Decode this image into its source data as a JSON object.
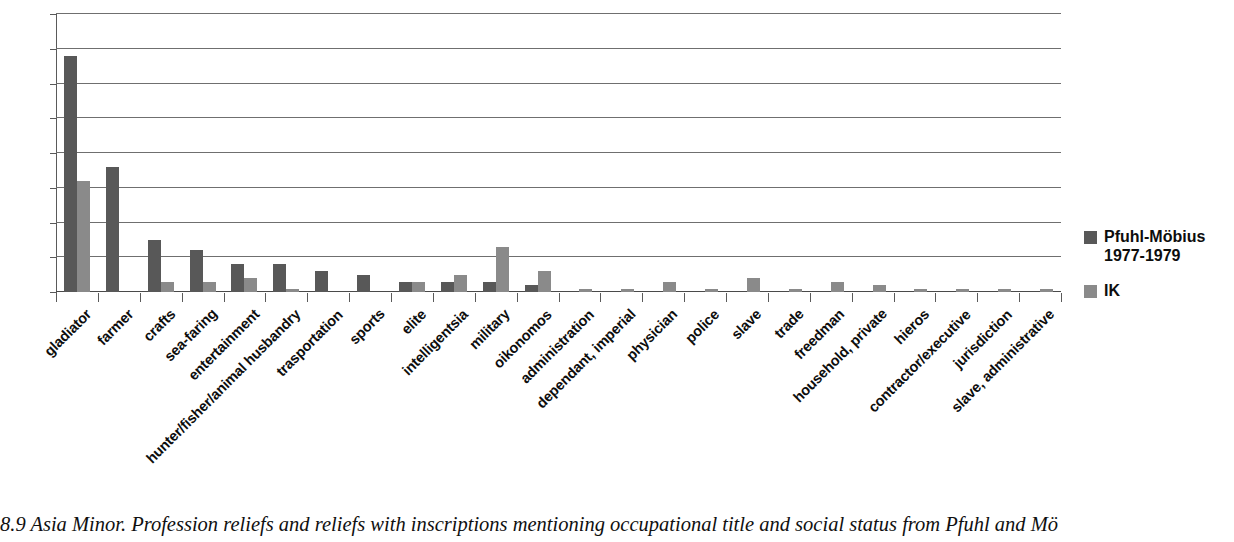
{
  "chart_data": {
    "type": "bar",
    "title": "",
    "xlabel": "",
    "ylabel": "",
    "ylim": [
      0,
      80
    ],
    "yticks": [
      0,
      10,
      20,
      30,
      40,
      50,
      60,
      70,
      80
    ],
    "grid": true,
    "legend_position": "right",
    "categories": [
      "gladiator",
      "farmer",
      "crafts",
      "sea-faring",
      "entertainment",
      "hunter/fisher/animal husbandry",
      "trasportation",
      "sports",
      "elite",
      "intelligentsia",
      "military",
      "oikonomos",
      "administration",
      "dependant, imperial",
      "physician",
      "police",
      "slave",
      "trade",
      "freedman",
      "household, private",
      "hieros",
      "contractor/executive",
      "jurisdiction",
      "slave, administrative"
    ],
    "series": [
      {
        "name": "Pfuhl-Möbius 1977-1979",
        "color": "#585858",
        "values": [
          68,
          36,
          15,
          12,
          8,
          8,
          6,
          5,
          3,
          3,
          3,
          2,
          0,
          0,
          0,
          0,
          0,
          0,
          0,
          0,
          0,
          0,
          0,
          0
        ]
      },
      {
        "name": "IK",
        "color": "#8a8a8a",
        "values": [
          32,
          0,
          3,
          3,
          4,
          1,
          0,
          0,
          3,
          5,
          13,
          6,
          1,
          1,
          3,
          1,
          4,
          1,
          3,
          2,
          1,
          1,
          1,
          1
        ]
      }
    ]
  },
  "legend": {
    "entries": [
      {
        "label": "Pfuhl-Möbius\n1977-1979",
        "swatch": "#585858"
      },
      {
        "label": "IK",
        "swatch": "#8a8a8a"
      }
    ]
  },
  "caption": {
    "text": "8.9  Asia Minor. Profession reliefs and reliefs with inscriptions mentioning occupational title and social status from Pfuhl and Mö"
  }
}
